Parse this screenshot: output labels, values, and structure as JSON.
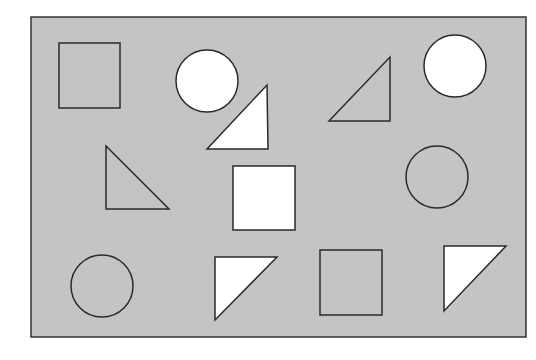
{
  "diagram": {
    "frame": {
      "x": 31,
      "y": 17,
      "w": 495,
      "h": 320,
      "fill": "#c4c4c4",
      "stroke": "#333333"
    },
    "colors": {
      "gray": "#c4c4c4",
      "white": "#ffffff",
      "stroke": "#2a2a2a"
    },
    "shapes": [
      {
        "id": "square-1",
        "type": "square",
        "fill": "gray",
        "x": 59,
        "y": 43,
        "w": 61,
        "h": 65
      },
      {
        "id": "circle-1",
        "type": "circle",
        "fill": "white",
        "cx": 207,
        "cy": 81,
        "r": 31
      },
      {
        "id": "triangle-1",
        "type": "triangle",
        "fill": "gray",
        "points": "329,121 390,57 390,121"
      },
      {
        "id": "circle-2",
        "type": "circle",
        "fill": "white",
        "cx": 455,
        "cy": 66,
        "r": 31
      },
      {
        "id": "triangle-2",
        "type": "triangle",
        "fill": "white",
        "points": "207,149 267,85 268,149"
      },
      {
        "id": "triangle-3",
        "type": "triangle",
        "fill": "gray",
        "points": "106,146 106,209 169,209"
      },
      {
        "id": "square-2",
        "type": "square",
        "fill": "white",
        "x": 233,
        "y": 166,
        "w": 62,
        "h": 64
      },
      {
        "id": "circle-3",
        "type": "circle",
        "fill": "gray",
        "cx": 437,
        "cy": 177,
        "r": 31
      },
      {
        "id": "circle-4",
        "type": "circle",
        "fill": "gray",
        "cx": 102,
        "cy": 286,
        "r": 31
      },
      {
        "id": "triangle-4",
        "type": "triangle",
        "fill": "white",
        "points": "215,257 277,257 215,320"
      },
      {
        "id": "square-3",
        "type": "square",
        "fill": "gray",
        "x": 320,
        "y": 250,
        "w": 62,
        "h": 65
      },
      {
        "id": "triangle-5",
        "type": "triangle",
        "fill": "white",
        "points": "444,246 506,246 444,311"
      }
    ]
  }
}
